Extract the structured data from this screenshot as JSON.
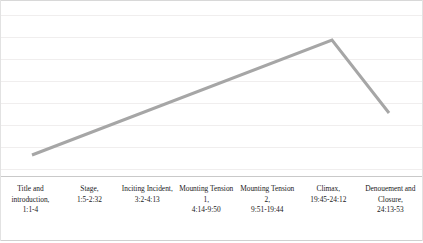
{
  "chart_data": {
    "type": "line",
    "title": "",
    "subtitle": "",
    "xlabel": "",
    "ylabel": "",
    "grid": true,
    "legend": false,
    "gridlines_y": [
      14,
      36,
      58,
      80,
      102,
      124,
      146,
      168
    ],
    "axis_note": "Vertical axis is unlabeled dramatic-tension level; horizontal axis is narrative stage / running time.",
    "categories": [
      "Title and introduction",
      "Stage",
      "Inciting Incident",
      "Mounting Tension 1",
      "Mounting Tension 2",
      "Climax",
      "Denouement and Closure"
    ],
    "timestamps": [
      "1:1-4",
      "1:5-2:32",
      "3:2-4:13",
      "4:14-9:50",
      "9:51-19:44",
      "19:45-24:12",
      "24:13-53"
    ],
    "x": [
      0,
      1,
      2,
      3,
      4,
      5,
      6
    ],
    "values": [
      0,
      1.3,
      2.6,
      3.8,
      5.1,
      6.4,
      2.4
    ],
    "ylim": [
      0,
      7
    ],
    "vertices_px": [
      {
        "x": 32,
        "y": 155
      },
      {
        "x": 332,
        "y": 40
      },
      {
        "x": 389,
        "y": 113
      }
    ],
    "series": [
      {
        "name": "Dramatic tension",
        "color": "#a6a6a6",
        "values": [
          0,
          1.3,
          2.6,
          3.8,
          5.1,
          6.4,
          2.4
        ]
      }
    ],
    "annotation": "Rising action climbs steadily from the opening to a peak at the Climax, then falls sharply through the Denouement."
  },
  "stages": [
    {
      "name": "Title and introduction,",
      "time": "1:1-4"
    },
    {
      "name": "Stage,",
      "time": "1:5-2:32"
    },
    {
      "name": "Inciting Incident,",
      "time": "3:2-4:13"
    },
    {
      "name": "Mounting Tension 1,",
      "time": "4:14-9:50"
    },
    {
      "name": "Mounting Tension 2,",
      "time": "9:51-19:44"
    },
    {
      "name": "Climax,",
      "time": "19:45-24:12"
    },
    {
      "name": "Denouement and Closure,",
      "time": "24:13-53"
    }
  ],
  "colors": {
    "line": "#a6a6a6",
    "grid": "#f0eeee",
    "frame": "#d8d8d8",
    "divider": "#c9c9c9",
    "text": "#1a1a1a",
    "background": "#ffffff"
  }
}
